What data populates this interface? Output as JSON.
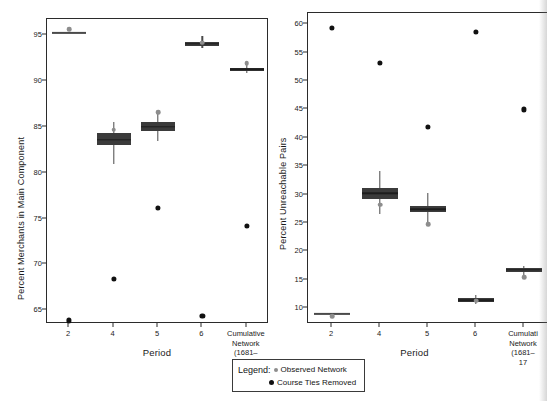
{
  "figure": {
    "background": "#ffffff",
    "box_color": "#3b3b3b",
    "observed_color": "#8d8d8d",
    "removed_color": "#111111"
  },
  "legend": {
    "title": "Legend:",
    "entries": [
      {
        "label": "Observed Network",
        "marker": "observed-dot",
        "color": "#8d8d8d"
      },
      {
        "label": "Course Ties Removed",
        "marker": "removed-dot",
        "color": "#111111"
      }
    ]
  },
  "chart_data": [
    {
      "type": "box",
      "panel": "left",
      "title": "",
      "xlabel": "Period",
      "ylabel": "Percent Merchants in Main Component",
      "ylim": [
        63.5,
        96.8
      ],
      "yticks": [
        65,
        70,
        75,
        80,
        85,
        90,
        95
      ],
      "categories": [
        "2",
        "4",
        "5",
        "6",
        "Cumulative\nNetwork\n(1681–1792)"
      ],
      "grid": false,
      "legend_position": "below-figure",
      "boxes": [
        {
          "category": "2",
          "q1": 95.3,
          "q3": 95.3,
          "median": 95.3,
          "whisker_low": 95.3,
          "whisker_high": 95.3,
          "degenerate": true
        },
        {
          "category": "4",
          "q1": 83.0,
          "q3": 84.3,
          "median": 83.6,
          "whisker_low": 81.0,
          "whisker_high": 85.5,
          "degenerate": false
        },
        {
          "category": "5",
          "q1": 84.6,
          "q3": 85.5,
          "median": 85.0,
          "whisker_low": 83.5,
          "whisker_high": 86.7,
          "degenerate": false
        },
        {
          "category": "6",
          "q1": 93.9,
          "q3": 94.3,
          "median": 94.1,
          "whisker_low": 93.6,
          "whisker_high": 94.9,
          "degenerate": false
        },
        {
          "category": "Cumulative",
          "q1": 91.1,
          "q3": 91.5,
          "median": 91.3,
          "whisker_low": 90.9,
          "whisker_high": 91.9,
          "degenerate": false
        }
      ],
      "series": [
        {
          "name": "Observed Network",
          "color": "#8d8d8d",
          "values": [
            95.7,
            84.7,
            86.6,
            94.2,
            92.0
          ]
        },
        {
          "name": "Course Ties Removed",
          "color": "#111111",
          "values": [
            63.9,
            68.4,
            76.2,
            64.4,
            74.2
          ]
        }
      ]
    },
    {
      "type": "box",
      "panel": "right",
      "title": "",
      "xlabel": "Period",
      "ylabel": "Percent Unreachable Pairs",
      "ylim": [
        7.2,
        62.0
      ],
      "yticks": [
        10,
        15,
        20,
        25,
        30,
        35,
        40,
        45,
        50,
        55,
        60
      ],
      "categories": [
        "2",
        "4",
        "5",
        "6",
        "Cumulati\nNetwork\n(1681–17"
      ],
      "grid": false,
      "legend_position": "below-figure",
      "boxes": [
        {
          "category": "2",
          "q1": 9.0,
          "q3": 9.0,
          "median": 9.0,
          "whisker_low": 9.0,
          "whisker_high": 9.0,
          "degenerate": true
        },
        {
          "category": "4",
          "q1": 29.3,
          "q3": 31.1,
          "median": 30.2,
          "whisker_low": 26.6,
          "whisker_high": 34.2,
          "degenerate": false
        },
        {
          "category": "5",
          "q1": 26.9,
          "q3": 28.0,
          "median": 27.4,
          "whisker_low": 24.9,
          "whisker_high": 30.2,
          "degenerate": false
        },
        {
          "category": "6",
          "q1": 11.1,
          "q3": 11.8,
          "median": 11.4,
          "whisker_low": 10.7,
          "whisker_high": 12.3,
          "degenerate": false
        },
        {
          "category": "Cumulative",
          "q1": 16.4,
          "q3": 17.0,
          "median": 16.7,
          "whisker_low": 15.9,
          "whisker_high": 17.4,
          "degenerate": false
        }
      ],
      "series": [
        {
          "name": "Observed Network",
          "color": "#8d8d8d",
          "values": [
            8.6,
            28.2,
            24.8,
            11.3,
            15.4
          ]
        },
        {
          "name": "Course Ties Removed",
          "color": "#111111",
          "values": [
            59.4,
            53.2,
            41.9,
            58.7,
            45.0
          ]
        }
      ]
    }
  ]
}
